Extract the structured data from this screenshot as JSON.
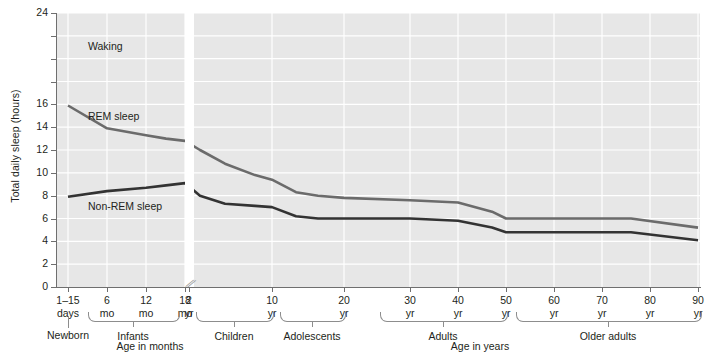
{
  "chart_data": {
    "type": "line",
    "title": "",
    "xlabel": "Age",
    "ylabel": "Total daily sleep (hours)",
    "ylim": [
      0,
      24
    ],
    "grid": true,
    "legend_position": "inline-annotations",
    "y_ticks": [
      "24",
      "22",
      "20",
      "18",
      "16",
      "14",
      "12",
      "10",
      "8",
      "6",
      "4",
      "2",
      "0"
    ],
    "y_tick_values": [
      24,
      22,
      20,
      18,
      16,
      14,
      12,
      10,
      8,
      6,
      4,
      2,
      0
    ],
    "y_labels_shown": [
      "24",
      "16",
      "14",
      "12",
      "10",
      "8",
      "6",
      "4",
      "2",
      "0"
    ],
    "x_ticks": [
      {
        "line1": "1–15",
        "line2": "days"
      },
      {
        "line1": "6",
        "line2": "mo"
      },
      {
        "line1": "12",
        "line2": "mo"
      },
      {
        "line1": "18",
        "line2": "mo"
      },
      {
        "line1": "2",
        "line2": "yr"
      },
      {
        "line1": "10",
        "line2": "yr"
      },
      {
        "line1": "20",
        "line2": "yr"
      },
      {
        "line1": "30",
        "line2": "yr"
      },
      {
        "line1": "40",
        "line2": "yr"
      },
      {
        "line1": "50",
        "line2": "yr"
      },
      {
        "line1": "60",
        "line2": "yr"
      },
      {
        "line1": "70",
        "line2": "yr"
      },
      {
        "line1": "80",
        "line2": "yr"
      },
      {
        "line1": "90",
        "line2": "yr"
      }
    ],
    "axis_break": {
      "present": true,
      "symbol": "⫻",
      "between": [
        "2 yr",
        "10 yr"
      ]
    },
    "region_labels": [
      {
        "name": "waking",
        "text": "Waking"
      },
      {
        "name": "rem",
        "text": "REM sleep"
      },
      {
        "name": "non-rem",
        "text": "Non-REM sleep"
      }
    ],
    "group_brackets": [
      {
        "label": "Newborn",
        "type": "stem"
      },
      {
        "label": "Infants",
        "type": "bracket"
      },
      {
        "label": "Children",
        "type": "bracket"
      },
      {
        "label": "Adolescents",
        "type": "bracket"
      },
      {
        "label": "Adults",
        "type": "bracket"
      },
      {
        "label": "Older adults",
        "type": "bracket"
      }
    ],
    "axis_captions": [
      {
        "name": "months",
        "text": "Age in months"
      },
      {
        "name": "years",
        "text": "Age in years"
      }
    ],
    "series": [
      {
        "name": "Waking / REM boundary (total sleep)",
        "color": "#6b6b6b",
        "points": [
          {
            "age": "1-15 days",
            "hours": 15.9
          },
          {
            "age": "6 mo",
            "hours": 13.9
          },
          {
            "age": "12 mo",
            "hours": 13.3
          },
          {
            "age": "18 mo",
            "hours": 13.0
          },
          {
            "age": "2 yr",
            "hours": 12.8
          },
          {
            "age": "3 yr",
            "hours": 12.0
          },
          {
            "age": "5 yr",
            "hours": 10.8
          },
          {
            "age": "8 yr",
            "hours": 9.8
          },
          {
            "age": "10 yr",
            "hours": 9.4
          },
          {
            "age": "13 yr",
            "hours": 8.3
          },
          {
            "age": "16 yr",
            "hours": 8.0
          },
          {
            "age": "20 yr",
            "hours": 7.8
          },
          {
            "age": "30 yr",
            "hours": 7.6
          },
          {
            "age": "40 yr",
            "hours": 7.4
          },
          {
            "age": "47 yr",
            "hours": 6.6
          },
          {
            "age": "50 yr",
            "hours": 6.0
          },
          {
            "age": "60 yr",
            "hours": 6.0
          },
          {
            "age": "76 yr",
            "hours": 6.0
          },
          {
            "age": "90 yr",
            "hours": 5.2
          }
        ]
      },
      {
        "name": "REM / Non-REM boundary",
        "color": "#333333",
        "points": [
          {
            "age": "1-15 days",
            "hours": 7.9
          },
          {
            "age": "6 mo",
            "hours": 8.4
          },
          {
            "age": "12 mo",
            "hours": 8.7
          },
          {
            "age": "18 mo",
            "hours": 8.9
          },
          {
            "age": "2 yr",
            "hours": 9.1
          },
          {
            "age": "3 yr",
            "hours": 8.0
          },
          {
            "age": "5 yr",
            "hours": 7.3
          },
          {
            "age": "8 yr",
            "hours": 7.1
          },
          {
            "age": "10 yr",
            "hours": 7.0
          },
          {
            "age": "13 yr",
            "hours": 6.2
          },
          {
            "age": "16 yr",
            "hours": 6.0
          },
          {
            "age": "20 yr",
            "hours": 6.0
          },
          {
            "age": "30 yr",
            "hours": 6.0
          },
          {
            "age": "40 yr",
            "hours": 5.8
          },
          {
            "age": "47 yr",
            "hours": 5.2
          },
          {
            "age": "50 yr",
            "hours": 4.8
          },
          {
            "age": "60 yr",
            "hours": 4.8
          },
          {
            "age": "76 yr",
            "hours": 4.8
          },
          {
            "age": "90 yr",
            "hours": 4.1
          }
        ]
      }
    ]
  }
}
